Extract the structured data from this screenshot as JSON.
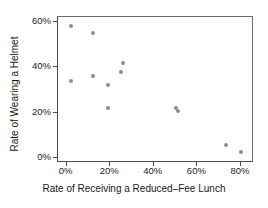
{
  "chart_data": {
    "type": "scatter",
    "title": "",
    "xlabel": "Rate of Receiving a Reduced–Fee Lunch",
    "ylabel": "Rate of Wearing a Helmet",
    "xlim": [
      -4,
      86
    ],
    "ylim": [
      -2,
      62
    ],
    "xticks": [
      0,
      20,
      40,
      60,
      80
    ],
    "xtick_labels": [
      "0%",
      "20%",
      "40%",
      "60%",
      "80%"
    ],
    "yticks": [
      0,
      20,
      40,
      60
    ],
    "ytick_labels": [
      "0%",
      "20%",
      "40%",
      "60%"
    ],
    "grid": false,
    "legend": null,
    "marker_color": "#8c8c8c",
    "axis_color": "#4d4d4d",
    "background": "#ffffff",
    "points": [
      {
        "x": 2,
        "y": 58
      },
      {
        "x": 2,
        "y": 34
      },
      {
        "x": 12,
        "y": 55
      },
      {
        "x": 12,
        "y": 36
      },
      {
        "x": 19,
        "y": 32
      },
      {
        "x": 19,
        "y": 22
      },
      {
        "x": 25,
        "y": 38
      },
      {
        "x": 26,
        "y": 42
      },
      {
        "x": 50,
        "y": 22
      },
      {
        "x": 51,
        "y": 21
      },
      {
        "x": 73,
        "y": 6
      },
      {
        "x": 80,
        "y": 3
      }
    ]
  }
}
